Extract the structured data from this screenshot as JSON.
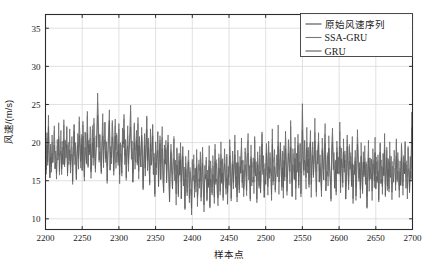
{
  "chart_data": {
    "type": "line",
    "title": "",
    "xlabel": "样本点",
    "ylabel": "风速/(m/s)",
    "xlim": [
      2200,
      2700
    ],
    "ylim": [
      8.6,
      36.8
    ],
    "xticks": [
      2200,
      2250,
      2300,
      2350,
      2400,
      2450,
      2500,
      2550,
      2600,
      2650,
      2700
    ],
    "yticks": [
      10,
      15,
      20,
      25,
      30,
      35
    ],
    "xtick_labels": [
      "2200",
      "2250",
      "2300",
      "2350",
      "2400",
      "2450",
      "2500",
      "2550",
      "2600",
      "2650",
      "2700"
    ],
    "ytick_labels": [
      "10",
      "15",
      "20",
      "25",
      "30",
      "35"
    ],
    "grid": true,
    "legend_position": "top-right",
    "legend": [
      {
        "name": "原始风速序列",
        "color": "#4d4d4d"
      },
      {
        "name": "SSA-GRU",
        "color": "#777777"
      },
      {
        "name": "GRU",
        "color": "#5a5a5a"
      }
    ],
    "series": [
      {
        "name": "原始风速序列",
        "color": "#4a4a4a",
        "x_start": 2200,
        "x_step": 1,
        "values": [
          19.2,
          16.4,
          21.3,
          17.0,
          23.6,
          18.2,
          15.4,
          19.8,
          16.1,
          21.0,
          17.4,
          19.0,
          22.2,
          16.6,
          18.9,
          15.2,
          20.4,
          17.8,
          22.6,
          16.2,
          18.4,
          21.6,
          15.8,
          19.4,
          17.2,
          23.0,
          16.8,
          20.2,
          18.0,
          22.0,
          15.6,
          19.6,
          17.6,
          21.8,
          16.0,
          18.6,
          20.8,
          14.9,
          19.1,
          22.4,
          17.1,
          20.0,
          15.1,
          18.3,
          21.2,
          16.5,
          23.4,
          19.3,
          17.5,
          20.6,
          16.3,
          22.8,
          18.1,
          15.5,
          21.4,
          19.7,
          17.3,
          24.1,
          16.9,
          20.3,
          18.7,
          22.1,
          15.3,
          19.0,
          21.7,
          17.0,
          23.2,
          18.5,
          16.1,
          20.9,
          19.4,
          26.5,
          22.3,
          17.7,
          21.1,
          18.8,
          15.9,
          20.5,
          23.8,
          16.7,
          19.9,
          22.7,
          17.9,
          20.1,
          15.0,
          18.2,
          21.5,
          24.3,
          16.4,
          19.5,
          17.2,
          22.9,
          20.7,
          15.7,
          18.9,
          23.1,
          16.6,
          21.0,
          19.2,
          17.4,
          22.5,
          14.6,
          20.0,
          18.4,
          16.0,
          21.9,
          19.8,
          23.7,
          17.1,
          20.4,
          15.4,
          18.7,
          22.2,
          16.2,
          19.6,
          21.3,
          24.9,
          17.8,
          20.2,
          14.8,
          18.0,
          22.6,
          16.5,
          19.1,
          21.6,
          17.3,
          23.3,
          15.2,
          20.8,
          18.3,
          16.8,
          22.0,
          19.4,
          13.8,
          17.6,
          21.2,
          15.6,
          19.9,
          23.5,
          16.3,
          20.6,
          18.1,
          14.4,
          21.8,
          17.0,
          19.3,
          22.4,
          15.8,
          18.6,
          12.9,
          20.1,
          16.7,
          19.0,
          21.4,
          14.2,
          17.9,
          20.9,
          15.1,
          18.8,
          22.1,
          16.1,
          13.4,
          19.7,
          17.2,
          20.3,
          14.7,
          18.4,
          21.0,
          15.5,
          12.2,
          17.5,
          19.8,
          16.4,
          13.9,
          18.0,
          20.5,
          15.0,
          17.7,
          11.8,
          19.2,
          16.0,
          13.2,
          18.6,
          15.7,
          20.0,
          12.6,
          17.1,
          19.5,
          14.3,
          16.8,
          11.2,
          18.2,
          15.4,
          13.0,
          17.4,
          19.0,
          12.1,
          16.2,
          14.6,
          10.5,
          17.8,
          15.0,
          18.4,
          12.8,
          16.6,
          13.5,
          19.1,
          11.6,
          15.8,
          17.2,
          14.0,
          18.8,
          12.3,
          16.0,
          19.4,
          13.8,
          10.9,
          17.0,
          15.2,
          18.1,
          12.5,
          16.4,
          14.1,
          19.6,
          11.4,
          17.6,
          15.6,
          13.1,
          18.3,
          16.1,
          12.0,
          19.8,
          14.5,
          17.3,
          15.0,
          11.7,
          18.0,
          16.7,
          13.6,
          20.1,
          14.8,
          17.9,
          12.4,
          16.3,
          19.2,
          15.3,
          13.2,
          18.5,
          11.9,
          16.9,
          14.4,
          20.4,
          17.1,
          12.7,
          15.7,
          18.9,
          13.9,
          16.5,
          21.0,
          14.1,
          17.4,
          12.2,
          19.0,
          15.9,
          13.4,
          18.2,
          16.0,
          20.6,
          14.7,
          17.7,
          12.9,
          15.4,
          19.3,
          16.8,
          13.7,
          18.6,
          21.2,
          15.1,
          17.0,
          12.6,
          19.7,
          14.3,
          16.2,
          18.0,
          13.3,
          20.8,
          15.6,
          17.5,
          12.1,
          18.8,
          16.4,
          14.0,
          19.5,
          13.5,
          17.2,
          21.4,
          15.8,
          18.3,
          12.8,
          16.6,
          14.5,
          19.9,
          17.0,
          13.1,
          20.2,
          15.3,
          18.7,
          16.1,
          12.4,
          21.8,
          14.9,
          17.6,
          19.1,
          13.8,
          16.0,
          18.4,
          15.5,
          22.3,
          13.2,
          17.3,
          20.0,
          16.7,
          14.2,
          18.9,
          12.7,
          19.6,
          15.0,
          21.5,
          17.8,
          13.6,
          16.3,
          20.4,
          18.1,
          14.6,
          22.9,
          16.9,
          13.0,
          19.2,
          17.4,
          15.2,
          20.7,
          12.5,
          18.6,
          16.1,
          21.1,
          14.4,
          17.9,
          19.8,
          13.3,
          16.5,
          25.1,
          18.2,
          15.7,
          20.3,
          17.1,
          13.9,
          22.0,
          16.0,
          19.4,
          14.1,
          18.8,
          21.6,
          12.8,
          17.5,
          20.1,
          15.4,
          18.0,
          23.2,
          16.6,
          13.5,
          19.0,
          17.2,
          21.3,
          14.8,
          18.4,
          16.2,
          12.9,
          20.6,
          17.8,
          15.1,
          19.7,
          22.5,
          13.7,
          16.8,
          18.3,
          14.3,
          20.9,
          17.0,
          15.6,
          12.3,
          19.1,
          21.9,
          16.4,
          18.7,
          14.0,
          17.6,
          13.1,
          20.2,
          15.9,
          18.1,
          16.0,
          22.7,
          13.4,
          19.3,
          17.3,
          14.7,
          20.5,
          16.1,
          18.9,
          12.6,
          15.3,
          21.0,
          17.7,
          13.8,
          19.5,
          16.5,
          18.2,
          14.2,
          20.8,
          12.0,
          17.1,
          15.8,
          19.0,
          13.0,
          16.3,
          21.7,
          18.5,
          14.9,
          17.4,
          12.7,
          20.0,
          16.7,
          13.3,
          18.8,
          15.5,
          19.6,
          14.5,
          17.2,
          11.5,
          16.0,
          20.3,
          13.6,
          18.0,
          15.2,
          17.8,
          12.4,
          19.2,
          16.8,
          14.1,
          20.7,
          13.9,
          17.5,
          15.0,
          18.4,
          12.2,
          16.4,
          19.9,
          14.6,
          17.0,
          13.2,
          18.6,
          15.7,
          21.2,
          12.9,
          16.2,
          19.4,
          14.3,
          17.9,
          13.5,
          20.1,
          15.4,
          18.2,
          12.5,
          16.9,
          14.8,
          19.0,
          17.3,
          13.7,
          20.5,
          15.1,
          18.7,
          16.5,
          12.8,
          17.6,
          14.4,
          19.8,
          16.1,
          13.1,
          18.3,
          15.9,
          20.0,
          14.0,
          17.1,
          12.6,
          19.3,
          16.6,
          13.4,
          18.1,
          15.3,
          24.0,
          17.7
        ]
      },
      {
        "name": "SSA-GRU",
        "color": "#6e6e6e",
        "x_start": 2200,
        "x_step": 1,
        "offset": 0.55
      },
      {
        "name": "GRU",
        "color": "#565656",
        "x_start": 2200,
        "x_step": 1,
        "offset": -0.8
      }
    ]
  },
  "style": {
    "axis_color": "#2b2b2b",
    "grid_color": "#d9d9d9",
    "background": "#ffffff"
  }
}
